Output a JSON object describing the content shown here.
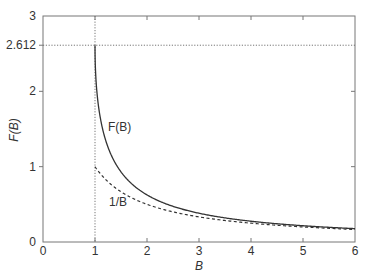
{
  "chart_data": {
    "type": "line",
    "title": "",
    "xlabel": "B",
    "ylabel": "F(B)",
    "xlim": [
      0,
      6
    ],
    "ylim": [
      0,
      3
    ],
    "x_ticks": [
      "0",
      "1",
      "2",
      "3",
      "4",
      "5",
      "6"
    ],
    "y_ticks": [
      "0",
      "1",
      "2",
      "3"
    ],
    "extra_y_tick": "2.612",
    "grid": false,
    "legend": "none (inline labels)",
    "reference_lines": [
      {
        "orientation": "horizontal",
        "value": 2.612,
        "style": "dotted"
      },
      {
        "orientation": "vertical",
        "value": 1,
        "style": "dotted"
      }
    ],
    "series": [
      {
        "name": "F(B)",
        "label": "F(B)",
        "style": "solid",
        "formula": "sum_k (1/B)^k / k^1.5",
        "x": [
          1.0,
          1.1,
          1.5,
          2.0,
          3.0,
          4.0,
          5.0,
          6.0
        ],
        "y": [
          2.612,
          1.584,
          0.93,
          0.625,
          0.382,
          0.276,
          0.216,
          0.178
        ]
      },
      {
        "name": "1/B",
        "label": "1/B",
        "style": "dashed",
        "formula": "1/B",
        "x": [
          1.0,
          1.5,
          2.0,
          3.0,
          4.0,
          5.0,
          6.0
        ],
        "y": [
          1.0,
          0.667,
          0.5,
          0.333,
          0.25,
          0.2,
          0.167
        ]
      }
    ],
    "annotations": [
      {
        "text": "F(B)",
        "x": 1.5,
        "y": 1.55
      },
      {
        "text": "1/B",
        "x": 1.45,
        "y": 0.55
      }
    ]
  }
}
